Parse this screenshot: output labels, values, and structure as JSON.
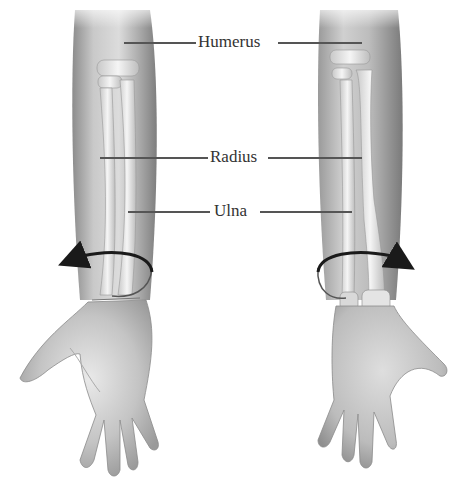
{
  "diagram": {
    "type": "anatomical-illustration",
    "labels": [
      {
        "id": "humerus",
        "text": "Humerus"
      },
      {
        "id": "radius",
        "text": "Radius"
      },
      {
        "id": "ulna",
        "text": "Ulna"
      }
    ],
    "views": [
      {
        "id": "left",
        "position": "left",
        "hand": "palm-facing-viewer",
        "arrow_direction": "counterclockwise-left"
      },
      {
        "id": "right",
        "position": "right",
        "hand": "back-of-hand-facing-viewer",
        "arrow_direction": "clockwise-right"
      }
    ],
    "colors": {
      "background": "#ffffff",
      "skin_light": "#e6e6e6",
      "skin_mid": "#bdbdbd",
      "skin_dark": "#8a8a8a",
      "bone": "#f2f2f2",
      "arrow": "#1a1a1a",
      "leader_line": "#555555",
      "label_text": "#333333"
    }
  }
}
